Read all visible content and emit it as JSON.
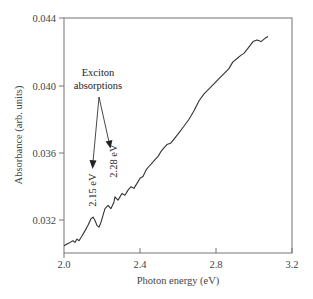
{
  "chart_data": {
    "type": "line",
    "title": "",
    "xlabel": "Photon energy (eV)",
    "ylabel": "Absorbance (arb. units)",
    "xlim": [
      2.0,
      3.2
    ],
    "ylim": [
      0.0302,
      0.044
    ],
    "xticks": [
      2.0,
      2.4,
      2.8,
      3.2
    ],
    "xtick_labels": [
      "2.0",
      "2.4",
      "2.8",
      "3.2"
    ],
    "yticks": [
      0.032,
      0.036,
      0.04,
      0.044
    ],
    "ytick_labels": [
      "0.032",
      "0.036",
      "0.040",
      "0.044"
    ],
    "grid": false,
    "legend": null,
    "series": [
      {
        "name": "Absorbance",
        "x": [
          2.0,
          2.016,
          2.032,
          2.047,
          2.058,
          2.068,
          2.079,
          2.095,
          2.111,
          2.126,
          2.142,
          2.153,
          2.163,
          2.174,
          2.184,
          2.195,
          2.205,
          2.216,
          2.232,
          2.247,
          2.263,
          2.268,
          2.284,
          2.295,
          2.305,
          2.321,
          2.337,
          2.353,
          2.368,
          2.384,
          2.4,
          2.416,
          2.432,
          2.447,
          2.463,
          2.479,
          2.495,
          2.511,
          2.526,
          2.542,
          2.563,
          2.584,
          2.605,
          2.632,
          2.658,
          2.684,
          2.711,
          2.737,
          2.763,
          2.789,
          2.816,
          2.842,
          2.868,
          2.889,
          2.911,
          2.932,
          2.947,
          2.968,
          2.995,
          3.016,
          3.037,
          3.058,
          3.074
        ],
        "values": [
          0.0305,
          0.0306,
          0.0307,
          0.0308,
          0.0307,
          0.0309,
          0.0308,
          0.0311,
          0.0314,
          0.0317,
          0.0321,
          0.0322,
          0.032,
          0.0317,
          0.0316,
          0.0319,
          0.0323,
          0.0327,
          0.0329,
          0.0327,
          0.0331,
          0.0334,
          0.0332,
          0.0334,
          0.0336,
          0.0335,
          0.0338,
          0.034,
          0.0339,
          0.0342,
          0.0345,
          0.0346,
          0.035,
          0.0352,
          0.0354,
          0.0356,
          0.0358,
          0.0361,
          0.0363,
          0.0365,
          0.0366,
          0.0369,
          0.0372,
          0.0376,
          0.038,
          0.0385,
          0.0391,
          0.0395,
          0.0398,
          0.0401,
          0.0404,
          0.0407,
          0.041,
          0.0414,
          0.0416,
          0.0418,
          0.0419,
          0.0422,
          0.0426,
          0.0427,
          0.0426,
          0.0428,
          0.0429
        ]
      }
    ],
    "annotations": [
      {
        "text": "Exciton absorptions",
        "lines": [
          "Exciton",
          "absorptions"
        ],
        "x": 2.18,
        "y": 0.0398
      },
      {
        "text": "2.15 eV",
        "x": 2.15,
        "y": 0.0329,
        "rotation": -90,
        "arrow_from": [
          2.185,
          0.0385
        ],
        "arrow_to": [
          2.153,
          0.0343
        ]
      },
      {
        "text": "2.28 eV",
        "x": 2.26,
        "y": 0.0348,
        "rotation": -90,
        "arrow_from": [
          2.185,
          0.0385
        ],
        "arrow_to": [
          2.242,
          0.0356
        ]
      }
    ]
  },
  "labels": {
    "xlabel": "Photon energy (eV)",
    "ylabel": "Absorbance (arb. units)",
    "annotation_line1": "Exciton",
    "annotation_line2": "absorptions",
    "peak1": "2.15 eV",
    "peak2": "2.28 eV",
    "xtick_0": "2.0",
    "xtick_1": "2.4",
    "xtick_2": "2.8",
    "xtick_3": "3.2",
    "ytick_0": "0.032",
    "ytick_1": "0.036",
    "ytick_2": "0.040",
    "ytick_3": "0.044"
  },
  "colors": {
    "line": "#333333",
    "axis": "#777777",
    "text": "#444444"
  }
}
